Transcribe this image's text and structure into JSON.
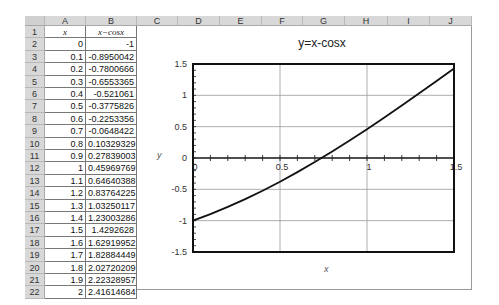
{
  "spreadsheet": {
    "columns": [
      "A",
      "B",
      "C",
      "D",
      "E",
      "F",
      "G",
      "H",
      "I",
      "J"
    ],
    "header_row": {
      "row": "1",
      "A": "x",
      "B": "x−cosx"
    },
    "rows": [
      {
        "row": "2",
        "A": "0",
        "B": "-1"
      },
      {
        "row": "3",
        "A": "0.1",
        "B": "-0.8950042"
      },
      {
        "row": "4",
        "A": "0.2",
        "B": "-0.7800666"
      },
      {
        "row": "5",
        "A": "0.3",
        "B": "-0.6553365"
      },
      {
        "row": "6",
        "A": "0.4",
        "B": "-0.521061"
      },
      {
        "row": "7",
        "A": "0.5",
        "B": "-0.3775826"
      },
      {
        "row": "8",
        "A": "0.6",
        "B": "-0.2253356"
      },
      {
        "row": "9",
        "A": "0.7",
        "B": "-0.0648422"
      },
      {
        "row": "10",
        "A": "0.8",
        "B": "0.10329329"
      },
      {
        "row": "11",
        "A": "0.9",
        "B": "0.27839003"
      },
      {
        "row": "12",
        "A": "1",
        "B": "0.45969769"
      },
      {
        "row": "13",
        "A": "1.1",
        "B": "0.64640388"
      },
      {
        "row": "14",
        "A": "1.2",
        "B": "0.83764225"
      },
      {
        "row": "15",
        "A": "1.3",
        "B": "1.03250117"
      },
      {
        "row": "16",
        "A": "1.4",
        "B": "1.23003286"
      },
      {
        "row": "17",
        "A": "1.5",
        "B": "1.4292628"
      },
      {
        "row": "18",
        "A": "1.6",
        "B": "1.62919952"
      },
      {
        "row": "19",
        "A": "1.7",
        "B": "1.82884449"
      },
      {
        "row": "20",
        "A": "1.8",
        "B": "2.02720209"
      },
      {
        "row": "21",
        "A": "1.9",
        "B": "2.22328957"
      },
      {
        "row": "22",
        "A": "2",
        "B": "2.41614684"
      }
    ]
  },
  "chart_data": {
    "type": "line",
    "title": "y=x-cosx",
    "xlabel": "x",
    "ylabel": "y",
    "xlim": [
      0,
      1.5
    ],
    "ylim": [
      -1.5,
      1.5
    ],
    "x_ticks": [
      "0",
      "0.5",
      "1",
      "1.5"
    ],
    "y_ticks": [
      "1.5",
      "1",
      "0.5",
      "0",
      "-0.5",
      "-1",
      "-1.5"
    ],
    "grid": true,
    "legend": "none",
    "series": [
      {
        "name": "x-cosx",
        "x": [
          0,
          0.1,
          0.2,
          0.3,
          0.4,
          0.5,
          0.6,
          0.7,
          0.8,
          0.9,
          1.0,
          1.1,
          1.2,
          1.3,
          1.4,
          1.5
        ],
        "values": [
          -1,
          -0.8950042,
          -0.7800666,
          -0.6553365,
          -0.521061,
          -0.3775826,
          -0.2253356,
          -0.0648422,
          0.10329329,
          0.27839003,
          0.45969769,
          0.64640388,
          0.83764225,
          1.03250117,
          1.23003286,
          1.4292628
        ]
      }
    ]
  }
}
